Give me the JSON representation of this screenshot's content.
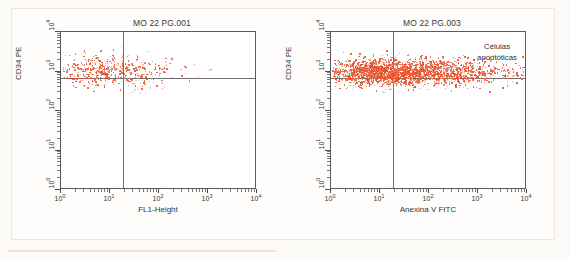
{
  "document": {
    "background_color": "#fdfbf8",
    "frame_color": "#efe7de",
    "scan_line_color": "#f6d9c4"
  },
  "colors": {
    "dot_dense": "#e8502a",
    "dot_mid": "#ef7048",
    "dot_light": "#f3a088",
    "dot_faint": "#d8d4d0",
    "axis": "#5b5b5b",
    "quadrant": "#6e6e6e",
    "text": "#343434"
  },
  "panels": [
    {
      "id": "panel-1",
      "title": "MO 22 PG.001",
      "xlabel": "FL1-Height",
      "ylabel": "CD34 PE",
      "annotation": null
    },
    {
      "id": "panel-2",
      "title": "MO 22 PG.003",
      "xlabel": "Anexina V FITC",
      "ylabel": "CD34 PE",
      "annotation_line1": "Células",
      "annotation_line2": "apoptóticas"
    }
  ],
  "axis_ticks": {
    "x": [
      "10",
      "10",
      "10",
      "10",
      "10"
    ],
    "x_exp": [
      "0",
      "1",
      "2",
      "3",
      "4"
    ],
    "y": [
      "10",
      "10",
      "10",
      "10",
      "10"
    ],
    "y_exp": [
      "0",
      "1",
      "2",
      "3",
      "4"
    ]
  },
  "chart_data": [
    {
      "type": "scatter",
      "title": "MO 22 PG.001",
      "xlabel": "FL1-Height",
      "ylabel": "CD34 PE",
      "xscale": "log",
      "yscale": "log",
      "xlim": [
        1,
        10000
      ],
      "ylim": [
        1,
        10000
      ],
      "grid": false,
      "legend": null,
      "gates": {
        "vertical_x": 18,
        "horizontal_y": 700
      },
      "quadrant_populations": {
        "upper_left": "dense cluster",
        "upper_right": "sparse",
        "lower_left": "empty",
        "lower_right": "empty"
      },
      "cluster": {
        "x_center_decades": 0.95,
        "x_spread_decades": 0.45,
        "y_center_decades": 3.05,
        "y_spread_decades": 0.2,
        "n_points": 470,
        "density": "moderate"
      }
    },
    {
      "type": "scatter",
      "title": "MO 22 PG.003",
      "xlabel": "Anexina V FITC",
      "ylabel": "CD34 PE",
      "xscale": "log",
      "yscale": "log",
      "xlim": [
        1,
        10000
      ],
      "ylim": [
        1,
        10000
      ],
      "grid": false,
      "legend": null,
      "annotations": [
        {
          "text": "Células apoptóticas",
          "quadrant": "upper_right"
        }
      ],
      "gates": {
        "vertical_x": 18,
        "horizontal_y": 700
      },
      "quadrant_populations": {
        "upper_left": "very dense",
        "upper_right": "dense tail",
        "lower_left": "empty",
        "lower_right": "empty"
      },
      "cluster": {
        "x_center_decades": 1.35,
        "x_spread_decades": 0.75,
        "y_center_decades": 3.0,
        "y_spread_decades": 0.16,
        "n_points": 2600,
        "density": "high"
      }
    }
  ]
}
